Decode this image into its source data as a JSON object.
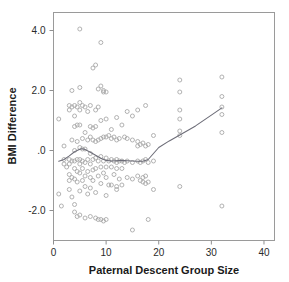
{
  "chart_data": {
    "type": "scatter",
    "title": "",
    "subtitle": "",
    "xlabel": "Paternal Descent Group Size",
    "ylabel": "BMI Difference",
    "xlim": [
      0,
      42
    ],
    "ylim": [
      -3.0,
      4.6
    ],
    "grid": false,
    "legend": null,
    "xticks": [
      0,
      10,
      20,
      30,
      40
    ],
    "xtick_labels": [
      "0",
      "10",
      "20",
      "30",
      "40"
    ],
    "yticks": [
      -2.0,
      0.0,
      2.0,
      4.0
    ],
    "ytick_labels": [
      "-2.0",
      ".0",
      "2.0",
      "4.0"
    ],
    "marker": "open-circle",
    "marker_color": "#a9a9a9",
    "series": [
      {
        "name": "observations",
        "points": [
          [
            1,
            1.05
          ],
          [
            1,
            -1.45
          ],
          [
            1.5,
            -1.85
          ],
          [
            2,
            0.15
          ],
          [
            2,
            -0.3
          ],
          [
            2,
            -0.45
          ],
          [
            2.5,
            -0.55
          ],
          [
            3,
            1.5
          ],
          [
            3,
            1.35
          ],
          [
            3,
            -0.3
          ],
          [
            3,
            -0.45
          ],
          [
            3,
            -0.8
          ],
          [
            3,
            -1.0
          ],
          [
            3,
            -1.3
          ],
          [
            3.5,
            2.0
          ],
          [
            3.5,
            1.45
          ],
          [
            3.5,
            0.35
          ],
          [
            3.5,
            -0.35
          ],
          [
            3.5,
            -0.9
          ],
          [
            3.5,
            -1.55
          ],
          [
            4,
            1.5
          ],
          [
            4,
            1.15
          ],
          [
            4,
            0.8
          ],
          [
            4,
            0.0
          ],
          [
            4,
            -0.35
          ],
          [
            4,
            -0.6
          ],
          [
            4,
            -0.95
          ],
          [
            4,
            -1.8
          ],
          [
            4,
            -2.05
          ],
          [
            4.5,
            1.45
          ],
          [
            4.5,
            0.85
          ],
          [
            4.5,
            0.3
          ],
          [
            4.5,
            -0.3
          ],
          [
            4.5,
            -0.7
          ],
          [
            4.5,
            -1.05
          ],
          [
            4.5,
            -2.2
          ],
          [
            5,
            4.05
          ],
          [
            5,
            2.1
          ],
          [
            5,
            1.6
          ],
          [
            5,
            1.35
          ],
          [
            5,
            0.85
          ],
          [
            5,
            0.1
          ],
          [
            5,
            -0.3
          ],
          [
            5,
            -0.45
          ],
          [
            5,
            -0.75
          ],
          [
            5,
            -1.35
          ],
          [
            5,
            -2.15
          ],
          [
            5.5,
            1.5
          ],
          [
            5.5,
            0.4
          ],
          [
            5.5,
            0.05
          ],
          [
            5.5,
            -0.35
          ],
          [
            5.5,
            -0.6
          ],
          [
            5.5,
            -1.0
          ],
          [
            6,
            1.45
          ],
          [
            6,
            0.6
          ],
          [
            6,
            0.05
          ],
          [
            6,
            -0.4
          ],
          [
            6,
            -0.85
          ],
          [
            6,
            -1.2
          ],
          [
            6,
            -2.25
          ],
          [
            6.5,
            1.3
          ],
          [
            6.5,
            0.35
          ],
          [
            6.5,
            -0.3
          ],
          [
            6.5,
            -0.7
          ],
          [
            6.5,
            -1.45
          ],
          [
            7,
            1.5
          ],
          [
            7,
            0.8
          ],
          [
            7,
            0.45
          ],
          [
            7,
            -0.1
          ],
          [
            7,
            -0.45
          ],
          [
            7,
            -0.9
          ],
          [
            7,
            -1.25
          ],
          [
            7,
            -2.2
          ],
          [
            7.5,
            2.75
          ],
          [
            7.5,
            0.75
          ],
          [
            7.5,
            0.35
          ],
          [
            7.5,
            -0.3
          ],
          [
            7.5,
            -0.65
          ],
          [
            7.5,
            -1.0
          ],
          [
            8,
            2.85
          ],
          [
            8,
            1.35
          ],
          [
            8,
            0.8
          ],
          [
            8,
            0.3
          ],
          [
            8,
            -0.25
          ],
          [
            8,
            -0.6
          ],
          [
            8,
            -1.4
          ],
          [
            8,
            -2.25
          ],
          [
            8.5,
            2.05
          ],
          [
            8.5,
            1.45
          ],
          [
            8.5,
            0.35
          ],
          [
            8.5,
            -0.35
          ],
          [
            8.5,
            -0.85
          ],
          [
            8.5,
            -2.3
          ],
          [
            9,
            3.6
          ],
          [
            9,
            2.15
          ],
          [
            9,
            1.0
          ],
          [
            9,
            0.4
          ],
          [
            9,
            -0.2
          ],
          [
            9,
            -0.55
          ],
          [
            9,
            -1.1
          ],
          [
            9,
            -2.3
          ],
          [
            9.5,
            2.0
          ],
          [
            9.5,
            1.95
          ],
          [
            9.5,
            0.45
          ],
          [
            9.5,
            -0.35
          ],
          [
            9.5,
            -0.75
          ],
          [
            9.5,
            -2.35
          ],
          [
            10,
            1.95
          ],
          [
            10,
            1.05
          ],
          [
            10,
            0.45
          ],
          [
            10,
            -0.25
          ],
          [
            10,
            -0.55
          ],
          [
            10,
            -0.9
          ],
          [
            10,
            -1.5
          ],
          [
            10,
            -2.3
          ],
          [
            10.5,
            0.5
          ],
          [
            10.5,
            -0.35
          ],
          [
            10.5,
            -1.15
          ],
          [
            11,
            0.7
          ],
          [
            11,
            0.4
          ],
          [
            11,
            -0.3
          ],
          [
            11,
            -0.55
          ],
          [
            11,
            -1.15
          ],
          [
            11.5,
            0.45
          ],
          [
            11.5,
            -0.35
          ],
          [
            11.5,
            -0.8
          ],
          [
            12,
            1.1
          ],
          [
            12,
            0.35
          ],
          [
            12,
            -0.3
          ],
          [
            12,
            -0.4
          ],
          [
            12,
            -0.6
          ],
          [
            12,
            -1.2
          ],
          [
            12,
            -1.3
          ],
          [
            12.5,
            0.4
          ],
          [
            12.5,
            -0.35
          ],
          [
            12.5,
            -0.95
          ],
          [
            13,
            0.85
          ],
          [
            13,
            -0.35
          ],
          [
            13,
            -0.6
          ],
          [
            13,
            -1.15
          ],
          [
            13.5,
            0.45
          ],
          [
            13.5,
            -0.4
          ],
          [
            14,
            1.3
          ],
          [
            14,
            0.4
          ],
          [
            14,
            -0.35
          ],
          [
            14,
            -0.9
          ],
          [
            15,
            1.15
          ],
          [
            15,
            0.35
          ],
          [
            15,
            -0.4
          ],
          [
            15,
            -0.95
          ],
          [
            15,
            -2.65
          ],
          [
            16,
            1.35
          ],
          [
            16,
            0.3
          ],
          [
            16,
            0.15
          ],
          [
            16,
            -0.35
          ],
          [
            16,
            -0.85
          ],
          [
            16.5,
            0.2
          ],
          [
            16.5,
            -0.4
          ],
          [
            16.5,
            -1.0
          ],
          [
            17,
            0.25
          ],
          [
            17,
            -0.35
          ],
          [
            17,
            -0.9
          ],
          [
            17,
            -1.05
          ],
          [
            17.5,
            1.5
          ],
          [
            17.5,
            0.15
          ],
          [
            17.5,
            -0.3
          ],
          [
            17.5,
            -0.85
          ],
          [
            17.5,
            -1.1
          ],
          [
            18,
            0.2
          ],
          [
            18,
            -0.4
          ],
          [
            18,
            -1.05
          ],
          [
            18,
            -2.3
          ],
          [
            19,
            0.5
          ],
          [
            19,
            -0.35
          ],
          [
            19,
            -1.3
          ],
          [
            24,
            2.35
          ],
          [
            24,
            1.95
          ],
          [
            24,
            1.35
          ],
          [
            24,
            1.05
          ],
          [
            24,
            0.65
          ],
          [
            24,
            0.5
          ],
          [
            24,
            -1.2
          ],
          [
            32,
            2.45
          ],
          [
            32,
            1.8
          ],
          [
            32,
            1.45
          ],
          [
            32,
            1.2
          ],
          [
            32,
            0.6
          ],
          [
            32,
            -1.85
          ]
        ]
      }
    ],
    "trend_line": {
      "name": "loess-smoother",
      "color": "#6d6d78",
      "points": [
        [
          1,
          -0.36
        ],
        [
          2,
          -0.3
        ],
        [
          3,
          -0.18
        ],
        [
          4,
          -0.04
        ],
        [
          5,
          0.04
        ],
        [
          5.5,
          0.06
        ],
        [
          6,
          0.03
        ],
        [
          7,
          -0.06
        ],
        [
          8,
          -0.16
        ],
        [
          9,
          -0.26
        ],
        [
          10,
          -0.33
        ],
        [
          11,
          -0.35
        ],
        [
          12,
          -0.34
        ],
        [
          13,
          -0.33
        ],
        [
          14,
          -0.34
        ],
        [
          15,
          -0.35
        ],
        [
          16,
          -0.36
        ],
        [
          17,
          -0.36
        ],
        [
          18,
          -0.3
        ],
        [
          19,
          -0.1
        ],
        [
          20,
          0.1
        ],
        [
          22,
          0.32
        ],
        [
          24,
          0.52
        ],
        [
          27,
          0.82
        ],
        [
          30,
          1.18
        ],
        [
          32,
          1.42
        ]
      ]
    }
  }
}
